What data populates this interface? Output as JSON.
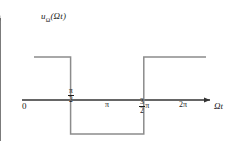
{
  "figure": {
    "title": "",
    "background_color": "#ffffff",
    "width": 236,
    "height": 163
  },
  "axes": {
    "y_label": "u",
    "y_label_subscript": "Ω",
    "y_label_arg": "(Ωt)",
    "x_label": "Ωt",
    "origin_label": "0",
    "axis_color": "#333333",
    "x_axis_y_px": 100,
    "y_axis_x_px": 33
  },
  "ticks": {
    "x": [
      {
        "id": "pi-over-2",
        "numerator": "π",
        "denominator": "2",
        "kind": "fraction",
        "value_pi": 0.5,
        "px": 73
      },
      {
        "id": "pi",
        "text": "π",
        "kind": "plain",
        "value_pi": 1.0,
        "px": 108
      },
      {
        "id": "three-halves-pi",
        "numerator": "3",
        "denominator": "2",
        "suffix": "π",
        "kind": "fraction-pi",
        "value_pi": 1.5,
        "px": 145
      },
      {
        "id": "two-pi",
        "text": "2π",
        "kind": "plain",
        "value_pi": 2.0,
        "px": 185
      }
    ]
  },
  "chart_data": {
    "type": "line",
    "title": "",
    "xlabel": "Ωt",
    "ylabel": "uΩ(Ωt)",
    "xlim": [
      0,
      2.35
    ],
    "ylim": [
      -1.15,
      1.2
    ],
    "x_unit": "π radians",
    "grid": false,
    "legend": null,
    "waveform": "square",
    "levels": {
      "high": 1,
      "low": -1
    },
    "series": [
      {
        "name": "uΩ(Ωt)",
        "color": "#8c8c8c",
        "x": [
          0,
          0.5,
          0.5,
          1.5,
          1.5,
          2.35
        ],
        "y": [
          1,
          1,
          -1,
          -1,
          1,
          1
        ],
        "segments": [
          {
            "from_pi": 0.0,
            "to_pi": 0.5,
            "level": 1
          },
          {
            "from_pi": 0.5,
            "to_pi": 1.5,
            "level": -1
          },
          {
            "from_pi": 1.5,
            "to_pi": 2.35,
            "level": 1
          }
        ]
      }
    ]
  },
  "geometry_px": {
    "high_level_y": 57,
    "low_level_y": 134,
    "zero_y": 100,
    "wave_start_x": 34,
    "wave_end_x": 206,
    "edge1_x": 73,
    "edge2_x": 145,
    "y_axis_top_y": 13,
    "y_axis_bottom_y": 141,
    "x_axis_left_x": 22,
    "x_axis_right_x": 215
  },
  "colors": {
    "wave": "#8c8c8c",
    "axis": "#333333",
    "text": "#1a1a1a",
    "background": "#ffffff"
  }
}
